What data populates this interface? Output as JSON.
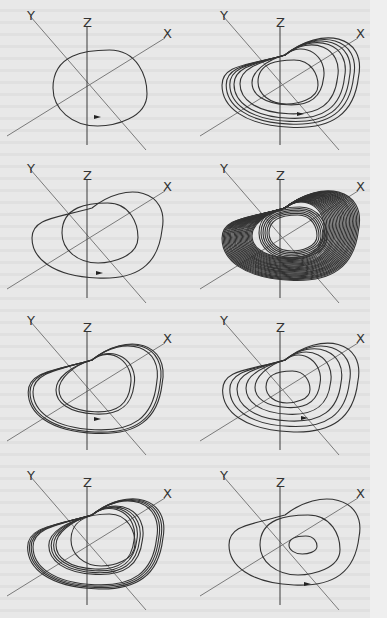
{
  "figure": {
    "axis_labels": {
      "x": "X",
      "y": "Y",
      "z": "Z"
    },
    "colors": {
      "background": "#e8e8e8",
      "trajectory": "#333333",
      "axis": "#7a7a7a"
    },
    "panels": [
      {
        "id": 1,
        "row": 1,
        "col": 1,
        "pattern": "single closed loop (period-1 limit cycle)",
        "loops": 1
      },
      {
        "id": 2,
        "row": 1,
        "col": 2,
        "pattern": "multiple nested loops (period-n cycle)",
        "loops": 6
      },
      {
        "id": 3,
        "row": 2,
        "col": 1,
        "pattern": "double loop (period-2 cycle)",
        "loops": 2
      },
      {
        "id": 4,
        "row": 2,
        "col": 2,
        "pattern": "dense chaotic band (strange attractor)",
        "loops": 30
      },
      {
        "id": 5,
        "row": 3,
        "col": 1,
        "pattern": "period-4 cycle, closely spaced loop pairs",
        "loops": 4
      },
      {
        "id": 6,
        "row": 3,
        "col": 2,
        "pattern": "nested loops period-5 cycle",
        "loops": 5
      },
      {
        "id": 7,
        "row": 4,
        "col": 1,
        "pattern": "banded chaotic attractor",
        "loops": 12
      },
      {
        "id": 8,
        "row": 4,
        "col": 2,
        "pattern": "outward spiral (homoclinic orbit)",
        "loops": 3
      }
    ]
  }
}
